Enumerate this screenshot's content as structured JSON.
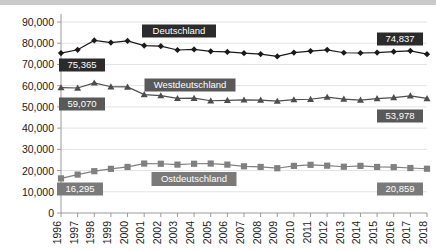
{
  "chart_data": {
    "type": "line",
    "title": "",
    "xlabel": "",
    "ylabel": "",
    "ylim": [
      0,
      90000
    ],
    "grid": true,
    "legend_position": "inline-annotation",
    "categories": [
      "1996",
      "1997",
      "1998",
      "1999",
      "2000",
      "2001",
      "2002",
      "2003",
      "2004",
      "2005",
      "2006",
      "2007",
      "2008",
      "2009",
      "2010",
      "2011",
      "2012",
      "2013",
      "2014",
      "2015",
      "2016",
      "2017",
      "2018"
    ],
    "ytick_labels": [
      "0",
      "10,000",
      "20,000",
      "30,000",
      "40,000",
      "50,000",
      "60,000",
      "70,000",
      "80,000",
      "90,000"
    ],
    "ytick_values": [
      0,
      10000,
      20000,
      30000,
      40000,
      50000,
      60000,
      70000,
      80000,
      90000
    ],
    "series": [
      {
        "name": "Deutschland",
        "marker": "diamond",
        "color": "#1a1a1a",
        "values": [
          75365,
          76900,
          81300,
          80300,
          81100,
          78900,
          78600,
          76800,
          77100,
          76200,
          75900,
          75300,
          74900,
          73800,
          75600,
          76300,
          76900,
          75500,
          75400,
          75600,
          76000,
          76400,
          74837
        ],
        "start_label": "75,365",
        "end_label": "74,837"
      },
      {
        "name": "Westdeutschland",
        "marker": "triangle",
        "color": "#4d4d4d",
        "values": [
          59070,
          58900,
          61300,
          59500,
          59400,
          55800,
          55300,
          54000,
          54100,
          52900,
          53100,
          53300,
          53200,
          52700,
          53400,
          53600,
          54600,
          53700,
          53200,
          53900,
          54400,
          55200,
          53978
        ],
        "start_label": "59,070",
        "end_label": "53,978"
      },
      {
        "name": "Ostdeutschland",
        "marker": "square",
        "color": "#808080",
        "values": [
          16295,
          18100,
          19700,
          20800,
          21700,
          23300,
          23200,
          22800,
          23200,
          23300,
          22800,
          22000,
          21700,
          21100,
          22200,
          22700,
          22300,
          21800,
          22200,
          21700,
          21600,
          21200,
          20859
        ],
        "start_label": "16,295",
        "end_label": "20,859"
      }
    ]
  },
  "annotations": {
    "series_labels": [
      {
        "text": "Deutschland",
        "bg": "#2b2b2b"
      },
      {
        "text": "Westdeutschland",
        "bg": "#595959"
      },
      {
        "text": "Ostdeutschland",
        "bg": "#7a7a7a"
      }
    ],
    "value_badges": [
      {
        "text": "75,365",
        "bg": "#2b2b2b"
      },
      {
        "text": "74,837",
        "bg": "#2b2b2b"
      },
      {
        "text": "59,070",
        "bg": "#595959"
      },
      {
        "text": "53,978",
        "bg": "#595959"
      },
      {
        "text": "16,295",
        "bg": "#7a7a7a"
      },
      {
        "text": "20,859",
        "bg": "#7a7a7a"
      }
    ]
  },
  "colors": {
    "deutschland": "#1a1a1a",
    "westdeutschland": "#4d4d4d",
    "ostdeutschland": "#808080",
    "grid": "#e3e3e3",
    "axis": "#9a9a9a",
    "topbar": "#c9c9c9"
  }
}
